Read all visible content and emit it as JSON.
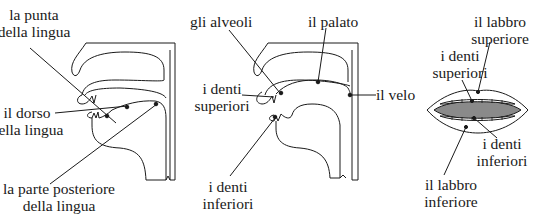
{
  "diagram": {
    "type": "anatomical-illustration",
    "panels": [
      {
        "id": "tongue-profile",
        "labels": {
          "tip": [
            "la punta",
            "della lingua"
          ],
          "dorsum": [
            "il dorso",
            "della lingua"
          ],
          "back": [
            "la parte posteriore",
            "della lingua"
          ]
        }
      },
      {
        "id": "palate-profile",
        "labels": {
          "alveoli": "gli alveoli",
          "palate": "il palato",
          "upper_teeth": [
            "i denti",
            "superiori"
          ],
          "velum": "il velo",
          "lower_teeth": [
            "i denti",
            "inferiori"
          ]
        }
      },
      {
        "id": "lips-front",
        "labels": {
          "upper_lip": [
            "il labbro",
            "superiore"
          ],
          "upper_teeth": [
            "i denti",
            "superiori"
          ],
          "lower_teeth": [
            "i denti",
            "inferiori"
          ],
          "lower_lip": [
            "il labbro",
            "inferiore"
          ]
        }
      }
    ],
    "colors": {
      "line": "#1a1a1a",
      "mouth_interior": "#8a8a8a",
      "background": "#ffffff"
    }
  }
}
